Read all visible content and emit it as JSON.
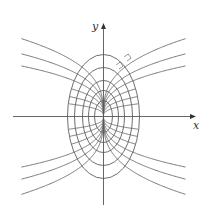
{
  "figure": {
    "axes": {
      "x_label": "x",
      "y_label": "y",
      "origin": [
        103.5,
        116.5
      ],
      "x_range_px": [
        13,
        196
      ],
      "y_range_px": [
        23,
        205
      ]
    },
    "ellipses": [
      {
        "rx": 36,
        "ry": 62
      },
      {
        "rx": 29,
        "ry": 49
      },
      {
        "rx": 21,
        "ry": 36
      },
      {
        "rx": 15,
        "ry": 26
      },
      {
        "rx": 9,
        "ry": 16
      }
    ],
    "trajectories": {
      "exponent": 0.34,
      "x_extent": 82,
      "clip_to_outer_ellipse_if_below": 1,
      "k_values_extending": [
        17.4,
        14.0,
        11.3
      ],
      "k_values_inner": [
        8.5,
        6.0,
        3.8
      ]
    },
    "right_angle_markers": [
      {
        "x": 127,
        "y": 61,
        "angle": -35,
        "size": 5
      },
      {
        "x": 119,
        "y": 69,
        "angle": -35,
        "size": 5
      }
    ],
    "colors": {
      "lines": "#5e5e5e",
      "background": "#ffffff"
    }
  }
}
